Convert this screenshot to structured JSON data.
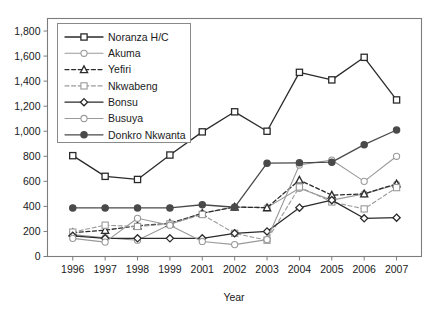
{
  "chart_data": {
    "type": "line",
    "title": "",
    "xlabel": "Year",
    "ylabel": "",
    "categories": [
      "1996",
      "1997",
      "1998",
      "1999",
      "2001",
      "2002",
      "2003",
      "2004",
      "2005",
      "2006",
      "2007"
    ],
    "x": [
      1996,
      1997,
      1998,
      1999,
      2001,
      2002,
      2003,
      2004,
      2005,
      2006,
      2007
    ],
    "ylim": [
      0,
      1900
    ],
    "yticks": [
      0,
      200,
      400,
      600,
      800,
      1000,
      1200,
      1400,
      1600,
      1800
    ],
    "ytick_labels": [
      "0",
      "200",
      "400",
      "600",
      "800",
      "1,000",
      "1,200",
      "1,400",
      "1,600",
      "1,800"
    ],
    "grid": false,
    "legend_position": "top-left",
    "series": [
      {
        "name": "Noranza H/C",
        "marker": "square-open",
        "line_style": "solid",
        "color": "#2b2b2b",
        "values": [
          805,
          640,
          615,
          810,
          995,
          1155,
          1000,
          1470,
          1410,
          1590,
          1250
        ]
      },
      {
        "name": "Akuma",
        "marker": "circle-open",
        "line_style": "solid",
        "color": "#9a9a9a",
        "values": [
          175,
          150,
          130,
          255,
          345,
          395,
          390,
          545,
          450,
          500,
          575
        ]
      },
      {
        "name": "Yefiri",
        "marker": "triangle-open",
        "line_style": "dashed",
        "color": "#2b2b2b",
        "values": [
          190,
          210,
          245,
          265,
          345,
          395,
          390,
          610,
          490,
          500,
          580
        ]
      },
      {
        "name": "Nkwabeng",
        "marker": "square-open",
        "line_style": "dashed",
        "color": "#9a9a9a",
        "values": [
          195,
          250,
          240,
          260,
          335,
          185,
          130,
          555,
          435,
          380,
          550
        ]
      },
      {
        "name": "Bonsu",
        "marker": "diamond-open",
        "line_style": "solid",
        "color": "#2b2b2b",
        "values": [
          165,
          145,
          145,
          145,
          145,
          185,
          200,
          390,
          450,
          305,
          310
        ]
      },
      {
        "name": "Busuya",
        "marker": "circle-open",
        "line_style": "solid",
        "color": "#9a9a9a",
        "values": [
          145,
          115,
          305,
          250,
          120,
          95,
          135,
          730,
          770,
          600,
          800
        ]
      },
      {
        "name": "Donkro Nkwanta",
        "marker": "circle-filled",
        "line_style": "solid",
        "color": "#4a4a4a",
        "values": [
          388,
          388,
          388,
          388,
          413,
          393,
          745,
          748,
          753,
          893,
          1010
        ]
      }
    ]
  },
  "legend": {
    "entries": [
      {
        "label": "Noranza H/C"
      },
      {
        "label": "Akuma"
      },
      {
        "label": "Yefiri"
      },
      {
        "label": "Nkwabeng"
      },
      {
        "label": "Bonsu"
      },
      {
        "label": "Busuya"
      },
      {
        "label": "Donkro Nkwanta"
      }
    ]
  }
}
